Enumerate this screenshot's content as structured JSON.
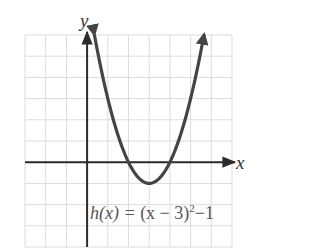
{
  "chart_data": {
    "type": "line",
    "title": "",
    "function_label": "h(x) = (x − 3)² − 1",
    "function_name": "h(x)",
    "equation": {
      "lhs": "h(x) =",
      "base": "(x − 3)",
      "exponent": "2",
      "tail": "−1"
    },
    "xlabel": "x",
    "ylabel": "y",
    "xlim": [
      -3,
      7
    ],
    "ylim": [
      -4,
      6
    ],
    "grid": true,
    "grid_step": 1,
    "tick_labels_shown": false,
    "vertex": [
      3,
      -1
    ],
    "roots": [
      2,
      4
    ],
    "y_intercept": 8,
    "x": [
      0.35,
      1,
      2,
      3,
      4,
      5,
      5.65
    ],
    "y": [
      6.0,
      3,
      0,
      -1,
      0,
      3,
      6.0
    ],
    "curve_ends_with_arrows": true
  },
  "labels": {
    "x_axis": "x",
    "y_axis": "y"
  },
  "colors": {
    "grid": "#dcdcdc",
    "axis": "#2b2b2b",
    "curve": "#444444",
    "text": "#555555"
  }
}
